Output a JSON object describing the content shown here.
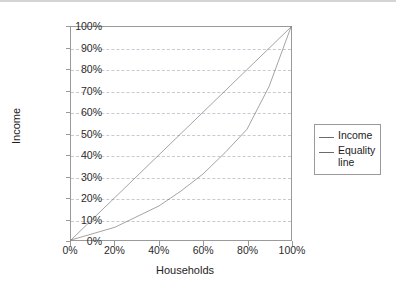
{
  "chart_data": {
    "type": "line",
    "title": "",
    "xlabel": "Households",
    "ylabel": "Income",
    "xlim": [
      0,
      100
    ],
    "ylim": [
      0,
      100
    ],
    "grid": true,
    "legend_position": "right",
    "x_ticks": [
      "0%",
      "20%",
      "40%",
      "60%",
      "80%",
      "100%"
    ],
    "x_tick_values": [
      0,
      20,
      40,
      60,
      80,
      100
    ],
    "y_ticks": [
      "0%",
      "10%",
      "20%",
      "30%",
      "40%",
      "50%",
      "60%",
      "70%",
      "80%",
      "90%",
      "100%"
    ],
    "y_tick_values": [
      0,
      10,
      20,
      30,
      40,
      50,
      60,
      70,
      80,
      90,
      100
    ],
    "x": [
      0,
      10,
      20,
      30,
      40,
      50,
      60,
      70,
      80,
      90,
      100
    ],
    "series": [
      {
        "name": "Income",
        "color": "#6b6b6b",
        "values": [
          0,
          3,
          6,
          11,
          16,
          23,
          31,
          41,
          52,
          72,
          100
        ]
      },
      {
        "name": "Equality line",
        "color": "#6b6b6b",
        "values": [
          0,
          10,
          20,
          30,
          40,
          50,
          60,
          70,
          80,
          90,
          100
        ]
      }
    ],
    "legend": [
      {
        "label": "Income",
        "color": "#6b6b6b"
      },
      {
        "label": "Equality\nline",
        "color": "#6b6b6b"
      }
    ]
  },
  "style": {
    "axis_color": "#9a9a9a",
    "grid_color": "#c9c9d6",
    "text_color": "#1d1d1d",
    "background": "#ffffff",
    "top_border": "#d4d4d4"
  }
}
